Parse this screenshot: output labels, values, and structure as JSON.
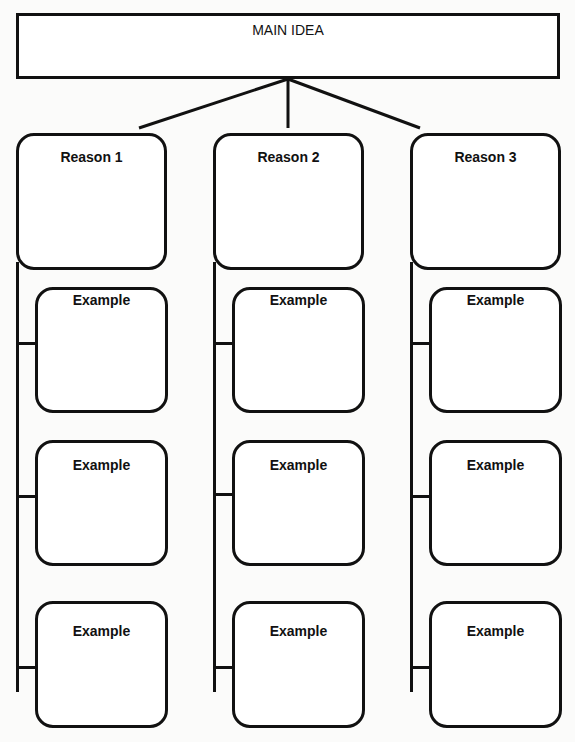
{
  "main_idea": {
    "label": "MAIN IDEA"
  },
  "reasons": [
    {
      "label": "Reason 1",
      "examples": [
        {
          "label": "Example"
        },
        {
          "label": "Example"
        },
        {
          "label": "Example"
        }
      ]
    },
    {
      "label": "Reason 2",
      "examples": [
        {
          "label": "Example"
        },
        {
          "label": "Example"
        },
        {
          "label": "Example"
        }
      ]
    },
    {
      "label": "Reason 3",
      "examples": [
        {
          "label": "Example"
        },
        {
          "label": "Example"
        },
        {
          "label": "Example"
        }
      ]
    }
  ],
  "colors": {
    "stroke": "#111111",
    "background": "#fbfbfa",
    "box_fill": "#ffffff"
  }
}
